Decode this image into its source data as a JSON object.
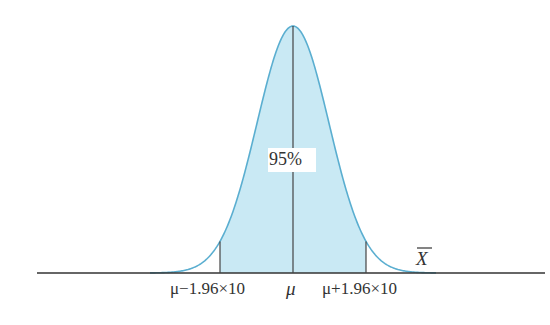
{
  "figure": {
    "type": "normal-distribution-confidence-interval",
    "center_label": "μ",
    "left_bound_label": "μ−1.96×10",
    "right_bound_label": "μ+1.96×10",
    "area_label": "95%",
    "axis_label": "X̄",
    "axis_label_base": "X",
    "colors": {
      "fill": "#c9e9f4",
      "curve": "#5aaed0",
      "axis": "#333333",
      "lines": "#444444"
    }
  }
}
